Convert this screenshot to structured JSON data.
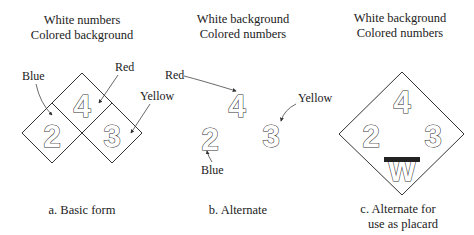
{
  "figure": {
    "panels": [
      {
        "id": "a",
        "header_line1": "White numbers",
        "header_line2": "Colored background",
        "numbers": {
          "top": "4",
          "left": "2",
          "right": "3"
        },
        "labels": {
          "blue": "Blue",
          "red": "Red",
          "yellow": "Yellow"
        },
        "caption": "a. Basic form"
      },
      {
        "id": "b",
        "header_line1": "White background",
        "header_line2": "Colored numbers",
        "numbers": {
          "top": "4",
          "left": "2",
          "right": "3"
        },
        "labels": {
          "red": "Red",
          "yellow": "Yellow",
          "blue": "Blue"
        },
        "caption": "b. Alternate"
      },
      {
        "id": "c",
        "header_line1": "White background",
        "header_line2": "Colored numbers",
        "numbers": {
          "top": "4",
          "left": "2",
          "right": "3",
          "bottom": "W"
        },
        "caption_line1": "c. Alternate for",
        "caption_line2": "use as placard"
      }
    ],
    "colors": {
      "line": "#333333",
      "background": "#ffffff",
      "text": "#222222"
    }
  }
}
